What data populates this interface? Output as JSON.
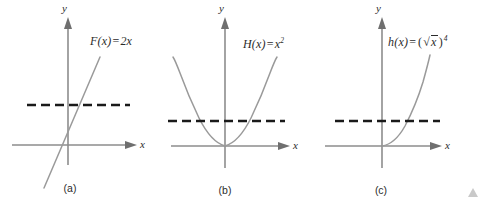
{
  "figure": {
    "colors": {
      "axis": "#8d8d8d",
      "curve": "#9a9a9a",
      "dashed_line": "#1a1a1a",
      "text": "#2b2b2b",
      "background": "#ffffff",
      "watermark": "#c9c9c9"
    },
    "panels": [
      {
        "id": "a",
        "caption": "(a)",
        "function_label": {
          "name": "F(x)",
          "operator": "=",
          "expression": "2x",
          "full": "F(x) = 2x"
        },
        "axis_x_label": "x",
        "axis_y_label": "y",
        "curve_type": "line",
        "dashed_line_intersections": 1
      },
      {
        "id": "b",
        "caption": "(b)",
        "function_label": {
          "name": "H(x)",
          "operator": "=",
          "expression_base": "x",
          "expression_exponent": "2",
          "full": "H(x) = x²"
        },
        "axis_x_label": "x",
        "axis_y_label": "y",
        "curve_type": "parabola",
        "dashed_line_intersections": 2
      },
      {
        "id": "c",
        "caption": "(c)",
        "function_label": {
          "name": "h(x)",
          "operator": "=",
          "expression_open": "(",
          "radical_sign": "√",
          "radicand": "x",
          "expression_close": ")",
          "expression_exponent": "4",
          "full": "h(x) = (√x)⁴"
        },
        "axis_x_label": "x",
        "axis_y_label": "y",
        "curve_type": "half-parabola",
        "dashed_line_intersections": 1
      }
    ]
  }
}
